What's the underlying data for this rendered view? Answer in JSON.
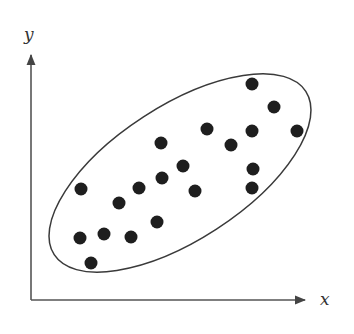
{
  "diagram": {
    "type": "scatter-with-ellipse",
    "x_axis_label": "x",
    "y_axis_label": "y",
    "colors": {
      "axis": "#555555",
      "ellipse": "#3a3a3a",
      "point": "#1e1e1e",
      "label": "#333333"
    },
    "axes": {
      "origin": [
        31,
        300
      ],
      "x_end": [
        305,
        300
      ],
      "y_end": [
        31,
        55
      ]
    },
    "ellipse": {
      "cx": 180,
      "cy": 173,
      "rx": 150,
      "ry": 67,
      "rotation_deg": -33
    },
    "point_radius": 6.5,
    "points": [
      [
        252,
        84
      ],
      [
        274,
        107
      ],
      [
        207,
        129
      ],
      [
        252,
        131
      ],
      [
        297,
        131
      ],
      [
        161,
        143
      ],
      [
        231,
        145
      ],
      [
        183,
        166
      ],
      [
        253,
        169
      ],
      [
        162,
        178
      ],
      [
        81,
        189
      ],
      [
        139,
        188
      ],
      [
        195,
        191
      ],
      [
        252,
        188
      ],
      [
        119,
        203
      ],
      [
        157,
        222
      ],
      [
        104,
        234
      ],
      [
        80,
        238
      ],
      [
        131,
        237
      ],
      [
        91,
        263
      ]
    ]
  }
}
